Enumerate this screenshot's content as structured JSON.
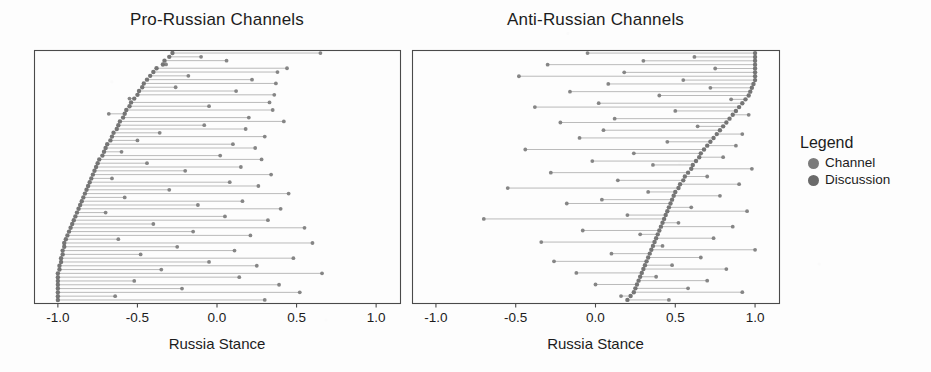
{
  "figure": {
    "background_color": "#fdfdfd",
    "ink_color": "#2b2b2b"
  },
  "legend": {
    "title": "Legend",
    "items": [
      {
        "label": "Channel",
        "color": "#7b7b7b"
      },
      {
        "label": "Discussion",
        "color": "#6a6a6a"
      }
    ]
  },
  "chart_data": [
    {
      "type": "scatter",
      "subplot": "left",
      "title": "Pro-Russian Channels",
      "xlabel": "Russia Stance",
      "ylabel": "",
      "xlim": [
        -1.15,
        1.15
      ],
      "xticks": [
        -1.0,
        -0.5,
        0.0,
        0.5,
        1.0
      ],
      "xticklabels": [
        "-1.0",
        "-0.5",
        "0.0",
        "0.5",
        "1.0"
      ],
      "grid": false,
      "legend_position": "right-outside",
      "series": [
        {
          "name": "Channel",
          "color": "#6f6f6f",
          "marker": "circle"
        },
        {
          "name": "Discussion",
          "color": "#808080",
          "marker": "circle"
        }
      ],
      "note": "Dumbbell rows sorted by channel stance, descending from top to bottom",
      "rows": [
        {
          "channel": -0.28,
          "discussion": 0.65
        },
        {
          "channel": -0.3,
          "discussion": -0.1
        },
        {
          "channel": -0.33,
          "discussion": 0.06
        },
        {
          "channel": -0.34,
          "discussion": -0.32
        },
        {
          "channel": -0.38,
          "discussion": 0.44
        },
        {
          "channel": -0.4,
          "discussion": 0.38
        },
        {
          "channel": -0.42,
          "discussion": -0.18
        },
        {
          "channel": -0.44,
          "discussion": 0.22
        },
        {
          "channel": -0.46,
          "discussion": 0.37
        },
        {
          "channel": -0.47,
          "discussion": -0.26
        },
        {
          "channel": -0.49,
          "discussion": 0.12
        },
        {
          "channel": -0.5,
          "discussion": 0.36
        },
        {
          "channel": -0.52,
          "discussion": -0.55
        },
        {
          "channel": -0.54,
          "discussion": 0.33
        },
        {
          "channel": -0.55,
          "discussion": -0.05
        },
        {
          "channel": -0.57,
          "discussion": 0.35
        },
        {
          "channel": -0.58,
          "discussion": -0.68
        },
        {
          "channel": -0.59,
          "discussion": 0.2
        },
        {
          "channel": -0.61,
          "discussion": 0.42
        },
        {
          "channel": -0.62,
          "discussion": -0.08
        },
        {
          "channel": -0.63,
          "discussion": 0.18
        },
        {
          "channel": -0.65,
          "discussion": -0.36
        },
        {
          "channel": -0.66,
          "discussion": 0.3
        },
        {
          "channel": -0.67,
          "discussion": -0.5
        },
        {
          "channel": -0.69,
          "discussion": 0.1
        },
        {
          "channel": -0.7,
          "discussion": 0.24
        },
        {
          "channel": -0.71,
          "discussion": -0.6
        },
        {
          "channel": -0.72,
          "discussion": 0.02
        },
        {
          "channel": -0.74,
          "discussion": 0.28
        },
        {
          "channel": -0.75,
          "discussion": -0.44
        },
        {
          "channel": -0.76,
          "discussion": 0.15
        },
        {
          "channel": -0.77,
          "discussion": -0.2
        },
        {
          "channel": -0.78,
          "discussion": 0.34
        },
        {
          "channel": -0.79,
          "discussion": -0.66
        },
        {
          "channel": -0.8,
          "discussion": 0.08
        },
        {
          "channel": -0.81,
          "discussion": 0.26
        },
        {
          "channel": -0.82,
          "discussion": -0.3
        },
        {
          "channel": -0.83,
          "discussion": 0.45
        },
        {
          "channel": -0.84,
          "discussion": -0.58
        },
        {
          "channel": -0.85,
          "discussion": 0.16
        },
        {
          "channel": -0.86,
          "discussion": -0.12
        },
        {
          "channel": -0.87,
          "discussion": 0.4
        },
        {
          "channel": -0.88,
          "discussion": -0.7
        },
        {
          "channel": -0.89,
          "discussion": 0.05
        },
        {
          "channel": -0.9,
          "discussion": 0.32
        },
        {
          "channel": -0.91,
          "discussion": -0.4
        },
        {
          "channel": -0.92,
          "discussion": 0.55
        },
        {
          "channel": -0.93,
          "discussion": -0.15
        },
        {
          "channel": -0.94,
          "discussion": 0.21
        },
        {
          "channel": -0.95,
          "discussion": -0.62
        },
        {
          "channel": -0.96,
          "discussion": 0.6
        },
        {
          "channel": -0.96,
          "discussion": -0.25
        },
        {
          "channel": -0.97,
          "discussion": 0.11
        },
        {
          "channel": -0.97,
          "discussion": -0.48
        },
        {
          "channel": -0.98,
          "discussion": 0.48
        },
        {
          "channel": -0.98,
          "discussion": -0.05
        },
        {
          "channel": -0.99,
          "discussion": 0.25
        },
        {
          "channel": -0.99,
          "discussion": -0.35
        },
        {
          "channel": -1.0,
          "discussion": 0.66
        },
        {
          "channel": -1.0,
          "discussion": 0.14
        },
        {
          "channel": -1.0,
          "discussion": -0.52
        },
        {
          "channel": -1.0,
          "discussion": 0.39
        },
        {
          "channel": -1.0,
          "discussion": -0.22
        },
        {
          "channel": -1.0,
          "discussion": 0.52
        },
        {
          "channel": -1.0,
          "discussion": -0.64
        },
        {
          "channel": -1.0,
          "discussion": 0.3
        }
      ]
    },
    {
      "type": "scatter",
      "subplot": "right",
      "title": "Anti-Russian Channels",
      "xlabel": "Russia Stance",
      "ylabel": "",
      "xlim": [
        -1.15,
        1.15
      ],
      "xticks": [
        -1.0,
        -0.5,
        0.0,
        0.5,
        1.0
      ],
      "xticklabels": [
        "-1.0",
        "-0.5",
        "0.0",
        "0.5",
        "1.0"
      ],
      "grid": false,
      "legend_position": "right-outside",
      "series": [
        {
          "name": "Channel",
          "color": "#6f6f6f",
          "marker": "circle"
        },
        {
          "name": "Discussion",
          "color": "#808080",
          "marker": "circle"
        }
      ],
      "note": "Dumbbell rows sorted by channel stance, descending from top to bottom",
      "rows": [
        {
          "channel": 1.0,
          "discussion": -0.05
        },
        {
          "channel": 1.0,
          "discussion": 0.62
        },
        {
          "channel": 1.0,
          "discussion": 0.3
        },
        {
          "channel": 1.0,
          "discussion": -0.3
        },
        {
          "channel": 1.0,
          "discussion": 0.75
        },
        {
          "channel": 1.0,
          "discussion": 0.18
        },
        {
          "channel": 1.0,
          "discussion": -0.48
        },
        {
          "channel": 1.0,
          "discussion": 0.55
        },
        {
          "channel": 0.99,
          "discussion": 0.08
        },
        {
          "channel": 0.98,
          "discussion": 0.72
        },
        {
          "channel": 0.97,
          "discussion": -0.16
        },
        {
          "channel": 0.96,
          "discussion": 0.4
        },
        {
          "channel": 0.94,
          "discussion": 0.85
        },
        {
          "channel": 0.92,
          "discussion": 0.02
        },
        {
          "channel": 0.9,
          "discussion": -0.38
        },
        {
          "channel": 0.88,
          "discussion": 0.5
        },
        {
          "channel": 0.86,
          "discussion": 0.96
        },
        {
          "channel": 0.84,
          "discussion": 0.12
        },
        {
          "channel": 0.82,
          "discussion": -0.22
        },
        {
          "channel": 0.8,
          "discussion": 0.64
        },
        {
          "channel": 0.78,
          "discussion": 0.05
        },
        {
          "channel": 0.76,
          "discussion": 0.92
        },
        {
          "channel": 0.74,
          "discussion": -0.1
        },
        {
          "channel": 0.72,
          "discussion": 0.45
        },
        {
          "channel": 0.7,
          "discussion": 0.88
        },
        {
          "channel": 0.68,
          "discussion": -0.44
        },
        {
          "channel": 0.66,
          "discussion": 0.24
        },
        {
          "channel": 0.65,
          "discussion": 0.8
        },
        {
          "channel": 0.63,
          "discussion": -0.02
        },
        {
          "channel": 0.61,
          "discussion": 0.36
        },
        {
          "channel": 0.6,
          "discussion": 0.98
        },
        {
          "channel": 0.58,
          "discussion": -0.28
        },
        {
          "channel": 0.56,
          "discussion": 0.7
        },
        {
          "channel": 0.55,
          "discussion": 0.14
        },
        {
          "channel": 0.53,
          "discussion": 0.9
        },
        {
          "channel": 0.52,
          "discussion": -0.55
        },
        {
          "channel": 0.5,
          "discussion": 0.33
        },
        {
          "channel": 0.49,
          "discussion": 0.78
        },
        {
          "channel": 0.48,
          "discussion": 0.04
        },
        {
          "channel": 0.47,
          "discussion": -0.18
        },
        {
          "channel": 0.46,
          "discussion": 0.6
        },
        {
          "channel": 0.45,
          "discussion": 0.95
        },
        {
          "channel": 0.44,
          "discussion": 0.2
        },
        {
          "channel": 0.43,
          "discussion": -0.7
        },
        {
          "channel": 0.42,
          "discussion": 0.52
        },
        {
          "channel": 0.41,
          "discussion": 0.86
        },
        {
          "channel": 0.4,
          "discussion": -0.08
        },
        {
          "channel": 0.39,
          "discussion": 0.28
        },
        {
          "channel": 0.38,
          "discussion": 0.74
        },
        {
          "channel": 0.37,
          "discussion": -0.34
        },
        {
          "channel": 0.36,
          "discussion": 0.42
        },
        {
          "channel": 0.35,
          "discussion": 1.0
        },
        {
          "channel": 0.34,
          "discussion": 0.1
        },
        {
          "channel": 0.33,
          "discussion": 0.66
        },
        {
          "channel": 0.32,
          "discussion": -0.26
        },
        {
          "channel": 0.31,
          "discussion": 0.48
        },
        {
          "channel": 0.3,
          "discussion": 0.82
        },
        {
          "channel": 0.29,
          "discussion": -0.12
        },
        {
          "channel": 0.28,
          "discussion": 0.38
        },
        {
          "channel": 0.27,
          "discussion": 0.7
        },
        {
          "channel": 0.26,
          "discussion": 0.0
        },
        {
          "channel": 0.25,
          "discussion": 0.58
        },
        {
          "channel": 0.24,
          "discussion": 0.92
        },
        {
          "channel": 0.22,
          "discussion": 0.16
        },
        {
          "channel": 0.2,
          "discussion": 0.46
        }
      ]
    }
  ]
}
